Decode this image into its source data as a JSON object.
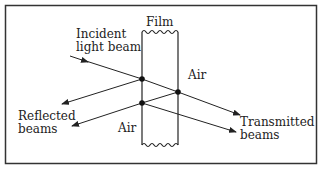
{
  "diagram": {
    "labels": {
      "film": "Film",
      "incident_line1": "Incident",
      "incident_line2": "light beam",
      "air_right": "Air",
      "air_left": "Air",
      "reflected_line1": "Reflected",
      "reflected_line2": "beams",
      "transmitted_line1": "Transmitted",
      "transmitted_line2": "beams"
    },
    "colors": {
      "line": "#222222",
      "frame": "#333333",
      "background": "#ffffff"
    }
  }
}
